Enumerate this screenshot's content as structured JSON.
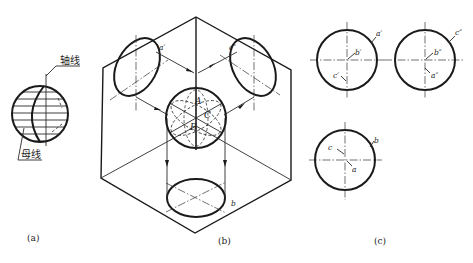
{
  "figure": {
    "panels": [
      {
        "id": "a",
        "caption": "(a)",
        "labels": {
          "axis": "轴线",
          "generatrix": "母线"
        }
      },
      {
        "id": "b",
        "caption": "(b)",
        "labels": {
          "a_prime": "a′",
          "c_double_prime": "c″",
          "b": "b",
          "A": "A",
          "B": "B",
          "C": "C"
        }
      },
      {
        "id": "c",
        "caption": "(c)",
        "front_view": {
          "outline": "a′",
          "center": "b′",
          "lower": "c′"
        },
        "side_view": {
          "outline": "c″",
          "center": "b″",
          "lower": "a″"
        },
        "top_view": {
          "outline": "b",
          "upper": "c",
          "lower": "a"
        }
      }
    ]
  }
}
